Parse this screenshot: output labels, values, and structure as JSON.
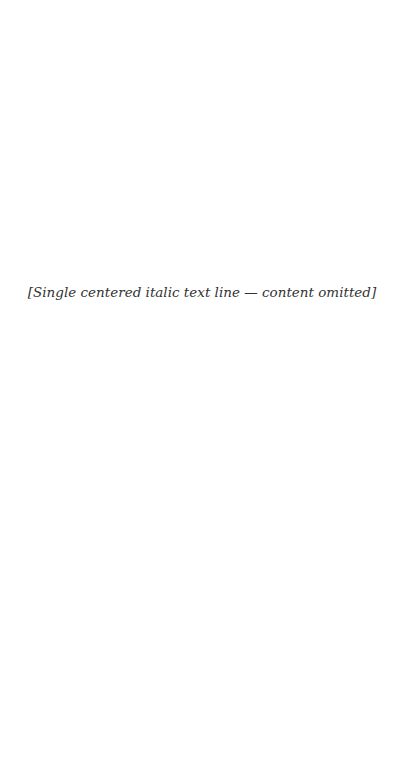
{
  "page": {
    "background": "#ffffff",
    "text_color": "#333333",
    "quote_line": "[Single centered italic text line — content omitted]"
  }
}
